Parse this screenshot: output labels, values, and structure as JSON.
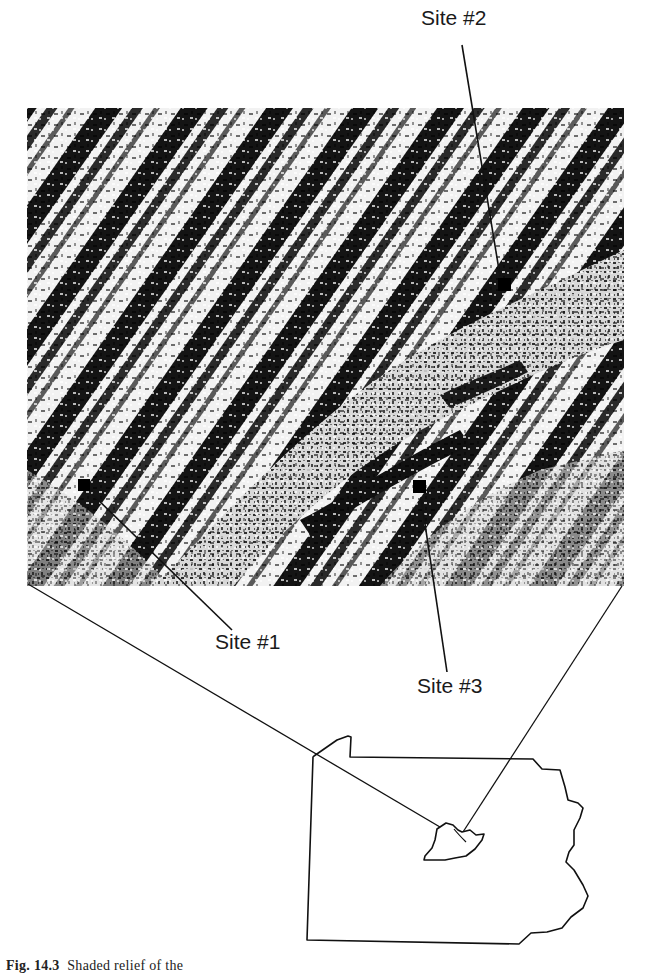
{
  "figure": {
    "labels": {
      "site1": "Site #1",
      "site2": "Site #2",
      "site3": "Site #3"
    },
    "caption": {
      "number": "Fig. 14.3",
      "text": "Shaded relief of the"
    },
    "relief_image": {
      "description": "Shaded-relief terrain of ridge-and-valley topography, black-and-white halftone",
      "marker_color": "#000000"
    },
    "inset_map": {
      "description": "Outline of Pennsylvania with highlighted study area"
    }
  }
}
